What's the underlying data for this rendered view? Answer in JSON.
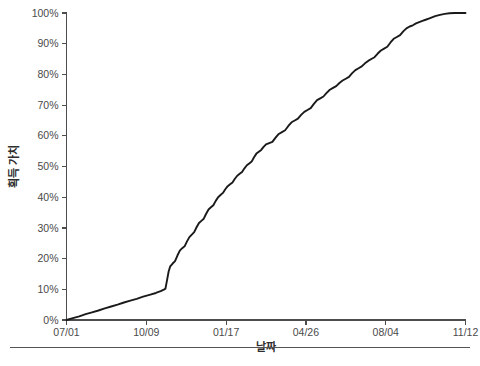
{
  "chart_data": {
    "type": "line",
    "title": "",
    "xlabel": "날짜",
    "ylabel": "획득 가치",
    "grid": false,
    "legend": false,
    "legend_position": "none",
    "line_color": "#1a1a1a",
    "axis_color": "#4d4d4d",
    "background": "#ffffff",
    "xlim": [
      0,
      500
    ],
    "ylim": [
      0,
      100
    ],
    "y_ticks": [
      0,
      10,
      20,
      30,
      40,
      50,
      60,
      70,
      80,
      90,
      100
    ],
    "y_tick_labels": [
      "0%",
      "10%",
      "20%",
      "30%",
      "40%",
      "50%",
      "60%",
      "70%",
      "80%",
      "90%",
      "100%"
    ],
    "x_ticks": [
      0,
      100,
      200,
      300,
      400,
      500
    ],
    "x_tick_labels": [
      "07/01",
      "10/09",
      "01/17",
      "04/26",
      "08/04",
      "11/12"
    ],
    "series": [
      {
        "name": "획득 가치",
        "points": [
          [
            0,
            0.0
          ],
          [
            8,
            0.6
          ],
          [
            16,
            1.2
          ],
          [
            24,
            1.9
          ],
          [
            32,
            2.5
          ],
          [
            40,
            3.1
          ],
          [
            48,
            3.8
          ],
          [
            56,
            4.4
          ],
          [
            64,
            5.0
          ],
          [
            72,
            5.7
          ],
          [
            80,
            6.3
          ],
          [
            88,
            6.9
          ],
          [
            96,
            7.6
          ],
          [
            104,
            8.2
          ],
          [
            112,
            8.8
          ],
          [
            118,
            9.4
          ],
          [
            122,
            9.9
          ],
          [
            124,
            10.2
          ],
          [
            126,
            13.0
          ],
          [
            128,
            15.8
          ],
          [
            130,
            17.5
          ],
          [
            133,
            18.4
          ],
          [
            136,
            19.2
          ],
          [
            139,
            21.0
          ],
          [
            142,
            22.6
          ],
          [
            145,
            23.4
          ],
          [
            148,
            24.0
          ],
          [
            151,
            25.6
          ],
          [
            154,
            27.0
          ],
          [
            157,
            27.8
          ],
          [
            160,
            28.6
          ],
          [
            163,
            30.2
          ],
          [
            166,
            31.6
          ],
          [
            169,
            32.3
          ],
          [
            172,
            33.0
          ],
          [
            175,
            34.6
          ],
          [
            178,
            36.0
          ],
          [
            181,
            36.7
          ],
          [
            184,
            37.4
          ],
          [
            187,
            38.8
          ],
          [
            190,
            40.0
          ],
          [
            193,
            40.7
          ],
          [
            196,
            41.4
          ],
          [
            199,
            42.6
          ],
          [
            202,
            43.6
          ],
          [
            205,
            44.2
          ],
          [
            208,
            44.8
          ],
          [
            211,
            46.0
          ],
          [
            214,
            47.0
          ],
          [
            217,
            47.6
          ],
          [
            220,
            48.2
          ],
          [
            223,
            49.4
          ],
          [
            226,
            50.4
          ],
          [
            229,
            51.0
          ],
          [
            232,
            51.6
          ],
          [
            235,
            53.0
          ],
          [
            238,
            54.2
          ],
          [
            241,
            54.8
          ],
          [
            244,
            55.4
          ],
          [
            247,
            56.4
          ],
          [
            250,
            57.2
          ],
          [
            254,
            57.6
          ],
          [
            258,
            58.0
          ],
          [
            262,
            59.4
          ],
          [
            266,
            60.6
          ],
          [
            270,
            61.2
          ],
          [
            274,
            61.8
          ],
          [
            278,
            63.2
          ],
          [
            282,
            64.4
          ],
          [
            286,
            65.0
          ],
          [
            290,
            65.6
          ],
          [
            294,
            66.8
          ],
          [
            298,
            67.8
          ],
          [
            302,
            68.4
          ],
          [
            306,
            69.0
          ],
          [
            310,
            70.4
          ],
          [
            314,
            71.6
          ],
          [
            318,
            72.2
          ],
          [
            322,
            72.8
          ],
          [
            326,
            74.0
          ],
          [
            330,
            75.0
          ],
          [
            334,
            75.6
          ],
          [
            338,
            76.2
          ],
          [
            342,
            77.2
          ],
          [
            346,
            78.0
          ],
          [
            350,
            78.6
          ],
          [
            354,
            79.2
          ],
          [
            358,
            80.4
          ],
          [
            362,
            81.4
          ],
          [
            366,
            82.0
          ],
          [
            370,
            82.6
          ],
          [
            374,
            83.6
          ],
          [
            378,
            84.4
          ],
          [
            382,
            85.0
          ],
          [
            386,
            85.6
          ],
          [
            390,
            86.8
          ],
          [
            394,
            87.8
          ],
          [
            398,
            88.4
          ],
          [
            402,
            89.0
          ],
          [
            406,
            90.4
          ],
          [
            410,
            91.6
          ],
          [
            414,
            92.2
          ],
          [
            418,
            92.8
          ],
          [
            422,
            94.0
          ],
          [
            426,
            95.0
          ],
          [
            430,
            95.6
          ],
          [
            434,
            96.0
          ],
          [
            438,
            96.6
          ],
          [
            442,
            97.0
          ],
          [
            446,
            97.4
          ],
          [
            450,
            97.8
          ],
          [
            454,
            98.2
          ],
          [
            458,
            98.6
          ],
          [
            462,
            99.0
          ],
          [
            468,
            99.4
          ],
          [
            474,
            99.7
          ],
          [
            480,
            99.9
          ],
          [
            486,
            100.0
          ],
          [
            493,
            100.0
          ],
          [
            500,
            100.0
          ]
        ]
      }
    ]
  },
  "footer": {
    "caption": ""
  }
}
